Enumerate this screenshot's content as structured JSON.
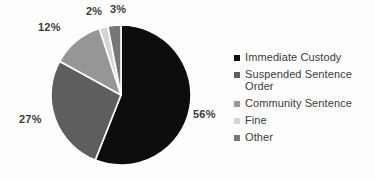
{
  "chart_data": {
    "type": "pie",
    "title": "",
    "subtitle": "",
    "xlabel": "",
    "ylabel": "",
    "legend_position": "right",
    "grid": false,
    "categories": [
      "Immediate Custody",
      "Suspended Sentence Order",
      "Community Sentence",
      "Fine",
      "Other"
    ],
    "values": [
      56,
      27,
      12,
      2,
      3
    ],
    "value_labels": [
      "56%",
      "27%",
      "12%",
      "2%",
      "3%"
    ],
    "colors": [
      "#0d0d0d",
      "#5e5e5e",
      "#969696",
      "#d4d4d4",
      "#777777"
    ],
    "slice_separator_color": "#ffffff",
    "start_angle_deg": 0,
    "direction": "clockwise",
    "slices": [
      {
        "label": "Immediate Custody",
        "value": 56,
        "value_label": "56%",
        "color": "#0d0d0d"
      },
      {
        "label": "Suspended Sentence Order",
        "value": 27,
        "value_label": "27%",
        "color": "#5e5e5e"
      },
      {
        "label": "Community Sentence",
        "value": 12,
        "value_label": "12%",
        "color": "#969696"
      },
      {
        "label": "Fine",
        "value": 2,
        "value_label": "2%",
        "color": "#d4d4d4"
      },
      {
        "label": "Other",
        "value": 3,
        "value_label": "3%",
        "color": "#777777"
      }
    ]
  },
  "legend": {
    "items": [
      {
        "label": "Immediate Custody"
      },
      {
        "label": "Suspended Sentence Order"
      },
      {
        "label": "Community Sentence"
      },
      {
        "label": "Fine"
      },
      {
        "label": "Other"
      }
    ]
  },
  "labels": {
    "immediate_custody": "56%",
    "suspended_sentence_order": "27%",
    "community_sentence": "12%",
    "fine": "2%",
    "other": "3%"
  },
  "theme": {
    "background": "#fdfdfd",
    "text_color": "#3b3b3b"
  }
}
